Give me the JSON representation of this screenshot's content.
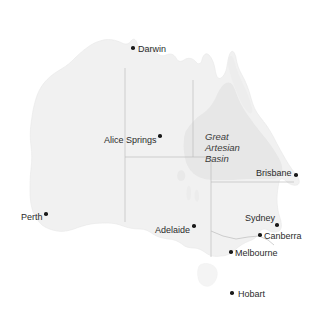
{
  "map": {
    "title": "Australia",
    "background_color": "#ffffff",
    "land_color": "#f1f1f1",
    "land_stroke_color": "#e4e4e4",
    "basin_color": "#e6e6e6",
    "border_color": "#b9b9b9",
    "label_color": "#2b2b2b",
    "dot_color": "#1a1a1a",
    "regions": [
      {
        "name": "great-artesian-basin",
        "label": "Great\nArtesian\nBasin",
        "label_x": 205,
        "label_y": 131,
        "fill": "#e6e6e6"
      }
    ],
    "cities": [
      {
        "name": "darwin",
        "label": "Darwin",
        "dot_x": 133,
        "dot_y": 48,
        "label_x": 138,
        "label_y": 45,
        "label_align": "left"
      },
      {
        "name": "alice-springs",
        "label": "Alice Springs",
        "dot_x": 160,
        "dot_y": 136,
        "label_x": 105,
        "label_y": 135,
        "label_align": "left"
      },
      {
        "name": "brisbane",
        "label": "Brisbane",
        "dot_x": 296,
        "dot_y": 175,
        "label_x": 256,
        "label_y": 168,
        "label_align": "left"
      },
      {
        "name": "perth",
        "label": "Perth",
        "dot_x": 46,
        "dot_y": 214,
        "label_x": 21,
        "label_y": 212,
        "label_align": "left"
      },
      {
        "name": "adelaide",
        "label": "Adelaide",
        "dot_x": 194,
        "dot_y": 226,
        "label_x": 156,
        "label_y": 225,
        "label_align": "left"
      },
      {
        "name": "sydney",
        "label": "Sydney",
        "dot_x": 277,
        "dot_y": 225,
        "label_x": 246,
        "label_y": 214,
        "label_align": "left"
      },
      {
        "name": "canberra",
        "label": "Canberra",
        "dot_x": 260,
        "dot_y": 235,
        "label_x": 264,
        "label_y": 231,
        "label_align": "left"
      },
      {
        "name": "melbourne",
        "label": "Melbourne",
        "dot_x": 231,
        "dot_y": 252,
        "label_x": 235,
        "label_y": 248,
        "label_align": "left"
      },
      {
        "name": "hobart",
        "label": "Hobart",
        "dot_x": 232,
        "dot_y": 293,
        "label_x": 238,
        "label_y": 289,
        "label_align": "left"
      }
    ],
    "state_borders": [
      {
        "name": "wa-nt-sa-border",
        "path": "M 125 68 L 125 157"
      },
      {
        "name": "nt-qld-border",
        "path": "M 193 80 L 193 157"
      },
      {
        "name": "sa-nt-qld-border",
        "path": "M 125 157 L 211 157"
      },
      {
        "name": "wa-sa-border",
        "path": "M 125 157 L 125 222"
      },
      {
        "name": "qld-nsw-border",
        "path": "M 211 157 L 211 182"
      },
      {
        "name": "sa-qld-nsw-border",
        "path": "M 211 182 L 293 182"
      },
      {
        "name": "sa-nsw-vic-border",
        "path": "M 211 182 L 211 257"
      },
      {
        "name": "nsw-vic-border",
        "path": "M 211 231 L 236 239 L 259 236 L 272 243"
      }
    ]
  }
}
